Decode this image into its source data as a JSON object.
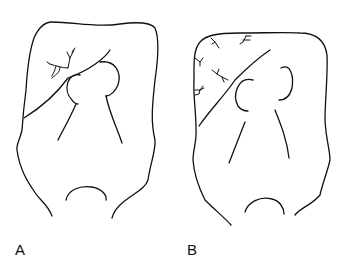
{
  "figure": {
    "panels": [
      {
        "label": "A",
        "description": "Skull outline with fracture line and localized branching cracks near the central arc"
      },
      {
        "label": "B",
        "description": "Skull outline with fracture line and multiple branching cracks along the upper-left border"
      }
    ],
    "colors": {
      "line": "#111111",
      "background": "#ffffff"
    }
  }
}
